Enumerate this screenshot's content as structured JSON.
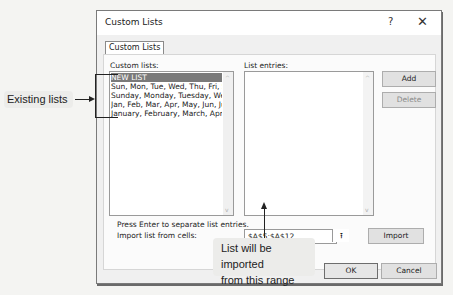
{
  "dialog": {
    "title": "Custom Lists",
    "help_label": "?",
    "close_label": "✕",
    "tab_label": "Custom Lists",
    "custom_lists_label": "Custom lists:",
    "custom_lists": [
      "NEW LIST",
      "Sun, Mon, Tue, Wed, Thu, Fri, Sat",
      "Sunday, Monday, Tuesday, Wednesday",
      "Jan, Feb, Mar, Apr, May, Jun, Jul",
      "January, February, March, April"
    ],
    "selected_index": 0,
    "list_entries_label": "List entries:",
    "list_entries": [],
    "add_label": "Add",
    "delete_label": "Delete",
    "hint_text": "Press Enter to separate list entries.",
    "import_label": "Import list from cells:",
    "import_range_value": "$A$5:$A$12",
    "collapse_icon": "⭱",
    "import_button_label": "Import",
    "ok_label": "OK",
    "cancel_label": "Cancel",
    "scroll_up_icon": "^",
    "scroll_down_icon": "v"
  },
  "callouts": {
    "existing_lists": "Existing lists",
    "import_range_line1": "List will be imported",
    "import_range_line2": "from this range"
  }
}
